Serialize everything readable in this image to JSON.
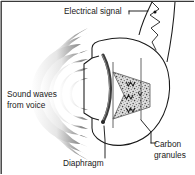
{
  "figure": {
    "name": "carbon-granule-microphone-diagram",
    "caption_present": false,
    "background_color": "#ffffff",
    "frame_color": "#3a3a3a",
    "ink_color": "#1a1a1a"
  },
  "labels": {
    "electrical_signal": "Electrical signal",
    "sound_waves_line1": "Sound waves",
    "sound_waves_line2": "from voice",
    "diaphragm": "Diaphragm",
    "carbon_line1": "Carbon",
    "carbon_line2": "granules"
  },
  "parts": {
    "sound_waves": {
      "name": "sound-waves",
      "count": 7,
      "shading": "gradient-grey",
      "dark_color": "#6b6b6b",
      "light_color": "#ffffff"
    },
    "diaphragm": {
      "name": "diaphragm",
      "color": "#3d3d3d",
      "shape": "curved-arc"
    },
    "carbon_granules": {
      "name": "carbon-granules-chamber",
      "shape": "trapezoid",
      "fill": "stippled",
      "fill_color": "#d8d8d8",
      "speck_color": "#4a4a4a"
    },
    "electrical_signal": {
      "name": "electrical-signal-waveform",
      "shape": "zigzag",
      "color": "#2a2a2a"
    },
    "handset_body": {
      "name": "handset-body-outline",
      "color": "#1a1a1a"
    }
  }
}
